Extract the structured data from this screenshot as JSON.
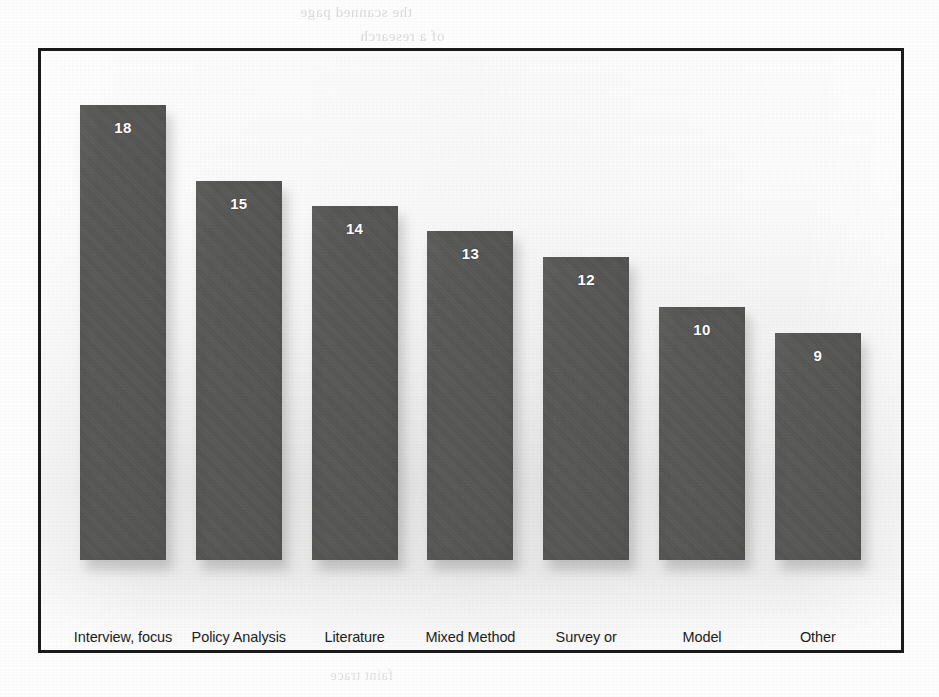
{
  "chart_data": {
    "type": "bar",
    "title": "",
    "subtitle": "",
    "xlabel": "",
    "ylabel": "",
    "ylim": [
      0,
      18
    ],
    "grid": false,
    "legend": null,
    "orientation": "vertical",
    "bar_color": "#585857",
    "value_label_color": "#ffffff",
    "frame_color": "#1b1b1b",
    "background_color": "#fbfbfb",
    "categories": [
      "Interview, focus group or workshop",
      "Policy Analysis",
      "Literature Review",
      "Mixed Method Approach",
      "Survey or questionnaire",
      "Model",
      "Other"
    ],
    "values": [
      18,
      15,
      14,
      13,
      12,
      10,
      9
    ],
    "bars": [
      {
        "label": "Interview, focus group or workshop",
        "label_lines": [
          "Interview, focus",
          "group or",
          "workshop"
        ],
        "value": 18,
        "value_text": "18"
      },
      {
        "label": "Policy Analysis",
        "label_lines": [
          "Policy Analysis"
        ],
        "value": 15,
        "value_text": "15"
      },
      {
        "label": "Literature Review",
        "label_lines": [
          "Literature",
          "Review"
        ],
        "value": 14,
        "value_text": "14"
      },
      {
        "label": "Mixed Method Approach",
        "label_lines": [
          "Mixed Method",
          "Approach"
        ],
        "value": 13,
        "value_text": "13"
      },
      {
        "label": "Survey or questionnaire",
        "label_lines": [
          "Survey or",
          "questionnaire"
        ],
        "value": 12,
        "value_text": "12"
      },
      {
        "label": "Model",
        "label_lines": [
          "Model"
        ],
        "value": 10,
        "value_text": "10"
      },
      {
        "label": "Other",
        "label_lines": [
          "Other"
        ],
        "value": 9,
        "value_text": "9"
      }
    ]
  },
  "page": {
    "background_ghost_text": [
      "the scanned page",
      "of a research",
      "faint show-through",
      "from reverse side",
      "illegible bleed",
      "text fragments",
      "page shadow",
      "mirrored print",
      "faint trace"
    ]
  }
}
